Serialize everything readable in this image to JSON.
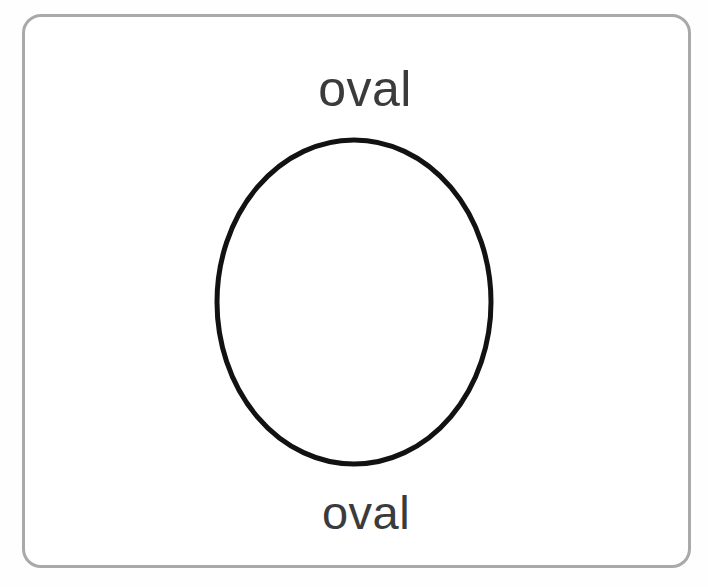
{
  "canvas": {
    "width": 708,
    "height": 587,
    "background_color": "#fefefe"
  },
  "frame": {
    "name": "card-frame",
    "border_color": "#a9a9a9",
    "fill_color": "#ffffff",
    "border_width_px": 3,
    "corner_radius_px": 19,
    "x": 22,
    "y": 14,
    "width": 669,
    "height": 554
  },
  "labels": {
    "top": {
      "text": "oval",
      "color": "#3b3b3b",
      "font_size_px": 50
    },
    "bottom": {
      "text": "oval",
      "color": "#3b3b3b",
      "font_size_px": 47
    }
  },
  "shape": {
    "type": "ellipse",
    "name": "oval",
    "stroke_color": "#121212",
    "fill": "none",
    "stroke_width_px": 5,
    "center_x": 354,
    "center_y": 302,
    "radius_x": 137,
    "radius_y": 162
  }
}
